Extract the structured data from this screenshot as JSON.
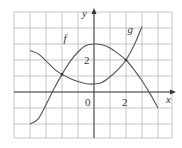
{
  "chart_data": {
    "type": "line",
    "title": "",
    "xlabel": "x",
    "ylabel": "y",
    "xlim": [
      -5,
      4.9
    ],
    "ylim": [
      -2.9,
      5
    ],
    "grid": true,
    "grid_spacing": 1,
    "tick_labels": {
      "x": [
        "0",
        "2"
      ],
      "y": [
        "2"
      ]
    },
    "series": [
      {
        "name": "f",
        "points": [
          [
            -4,
            -2
          ],
          [
            -3.5,
            -1.7
          ],
          [
            -3,
            -0.8
          ],
          [
            -2.5,
            0.2
          ],
          [
            -2,
            1.1
          ],
          [
            -1.5,
            1.9
          ],
          [
            -1,
            2.5
          ],
          [
            -0.5,
            2.9
          ],
          [
            0,
            3
          ],
          [
            0.5,
            2.95
          ],
          [
            1,
            2.75
          ],
          [
            1.5,
            2.4
          ],
          [
            2,
            2
          ],
          [
            2.5,
            1.4
          ],
          [
            3,
            0.7
          ],
          [
            3.5,
            -0.1
          ],
          [
            4,
            -1
          ]
        ]
      },
      {
        "name": "g",
        "points": [
          [
            -4,
            2.6
          ],
          [
            -3.5,
            2.4
          ],
          [
            -3,
            1.95
          ],
          [
            -2.5,
            1.45
          ],
          [
            -2,
            1.1
          ],
          [
            -1.5,
            0.85
          ],
          [
            -1,
            0.65
          ],
          [
            -0.5,
            0.52
          ],
          [
            0,
            0.5
          ],
          [
            0.5,
            0.6
          ],
          [
            1,
            0.95
          ],
          [
            1.5,
            1.4
          ],
          [
            2,
            2
          ],
          [
            2.5,
            2.9
          ],
          [
            3,
            4.1
          ]
        ]
      }
    ],
    "labels": {
      "f": {
        "text": "f",
        "x": -1.9,
        "y": 3.1
      },
      "g": {
        "text": "g",
        "x": 2.1,
        "y": 3.7
      },
      "x_axis": "x",
      "y_axis": "y",
      "origin": "0",
      "x_tick_2": "2",
      "y_tick_2": "2"
    }
  }
}
